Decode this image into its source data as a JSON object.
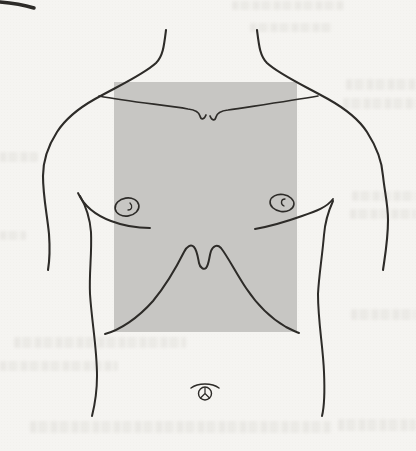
{
  "colors": {
    "page_background": "#f5f4f1",
    "shaded_region": "#c7c6c3",
    "line": "#2d2b28",
    "speck": "#8a8a86",
    "ghost_text": "rgba(125,119,106,0.14)"
  },
  "figure": {
    "kind": "torso-line-drawing",
    "shaded_area": "precordial-chest-region"
  },
  "bleed_through": {
    "present": true,
    "legible": false
  }
}
